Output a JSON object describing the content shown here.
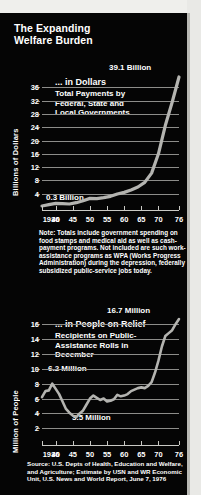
{
  "title": "The Expanding Welfare Burden",
  "title_line1": "The Expanding",
  "title_line2": "Welfare Burden",
  "note": "Note: Totals include government spending on food stamps and medical aid as well as cash-payment programs. Not included are such work-assistance programs as WPA (Works Progress Administration) during the depression, federally subsidized public-service jobs today.",
  "source": "Source: U.S. Depts of Health, Education and Welfare, and Agriculture; Estimate by USN and WR Economic Unit, U.S. News and World Report, June 7, 1976",
  "colors": {
    "background": "#050505",
    "paper": "#efefec",
    "text": "#ffffff",
    "series": "#b4b4b0",
    "grid": "#8d8d8a"
  },
  "chart_data": [
    {
      "type": "line",
      "id": "dollars",
      "title": "... in Dollars",
      "subtitle": "Total Payments by Federal, State and Local Governments",
      "subtitle_lines": [
        "Total Payments by",
        "Federal, State and",
        "Local Governments"
      ],
      "ylabel": "Billions of Dollars",
      "xlabel": "",
      "ylim": [
        0,
        39.1
      ],
      "yticks": [
        4,
        8,
        12,
        16,
        20,
        24,
        28,
        32,
        36
      ],
      "ytick_labels": [
        "4",
        "8",
        "12",
        "16",
        "20",
        "24",
        "28",
        "32",
        "36"
      ],
      "xlim": [
        1936,
        1976
      ],
      "xticks": [
        1936,
        1940,
        1945,
        1950,
        1955,
        1960,
        1965,
        1970,
        1976
      ],
      "xtick_labels": [
        "1936",
        "40",
        "45",
        "50",
        "55",
        "60",
        "65",
        "70",
        "76"
      ],
      "grid": true,
      "annotations": [
        {
          "text": "39.1 Billion",
          "x": 1976,
          "y": 39.1,
          "position": "top-right"
        },
        {
          "text": "0.3 Billion",
          "x": 1936,
          "y": 0.3,
          "position": "left"
        }
      ],
      "x": [
        1936,
        1938,
        1940,
        1942,
        1944,
        1946,
        1948,
        1950,
        1952,
        1954,
        1956,
        1958,
        1960,
        1962,
        1964,
        1966,
        1968,
        1970,
        1972,
        1974,
        1976
      ],
      "values": [
        0.3,
        0.7,
        1.1,
        1.0,
        0.9,
        1.3,
        1.9,
        2.6,
        2.5,
        2.8,
        3.2,
        3.9,
        4.4,
        5.1,
        6.0,
        7.4,
        10.2,
        16.0,
        24.5,
        31.5,
        39.1
      ]
    },
    {
      "type": "line",
      "id": "people",
      "title": "... in People on Relief",
      "subtitle": "Recipients on Public-Assistance Rolls in December",
      "subtitle_lines": [
        "Recipients on Public-",
        "Assistance Rolls in",
        "December"
      ],
      "ylabel": "Million of People",
      "xlabel": "",
      "ylim": [
        1.5,
        16.7
      ],
      "yticks": [
        2,
        4,
        6,
        8,
        10,
        12,
        14,
        16
      ],
      "ytick_labels": [
        "2",
        "4",
        "6",
        "8",
        "10",
        "12",
        "14",
        "16"
      ],
      "xlim": [
        1936,
        1976
      ],
      "xticks": [
        1936,
        1940,
        1945,
        1950,
        1955,
        1960,
        1965,
        1970,
        1976
      ],
      "xtick_labels": [
        "1936",
        "40",
        "45",
        "50",
        "55",
        "60",
        "65",
        "70",
        "76"
      ],
      "grid": true,
      "annotations": [
        {
          "text": "16.7 Million",
          "x": 1976,
          "y": 16.7,
          "position": "top-right"
        },
        {
          "text": "6.2 Million",
          "x": 1939,
          "y": 8.0,
          "position": "above"
        },
        {
          "text": "3.5 Million",
          "x": 1948,
          "y": 3.5,
          "position": "below"
        }
      ],
      "x": [
        1936,
        1937,
        1938,
        1939,
        1940,
        1941,
        1942,
        1943,
        1944,
        1945,
        1946,
        1947,
        1948,
        1949,
        1950,
        1951,
        1952,
        1953,
        1954,
        1955,
        1956,
        1957,
        1958,
        1959,
        1960,
        1961,
        1962,
        1963,
        1964,
        1965,
        1966,
        1967,
        1968,
        1969,
        1970,
        1971,
        1972,
        1973,
        1974,
        1975,
        1976
      ],
      "values": [
        6.2,
        7.0,
        7.1,
        8.0,
        7.3,
        6.6,
        5.6,
        4.6,
        4.1,
        3.7,
        3.5,
        4.0,
        4.4,
        5.2,
        6.0,
        6.4,
        6.1,
        5.8,
        6.0,
        5.6,
        5.7,
        5.9,
        6.5,
        6.3,
        6.4,
        6.6,
        7.0,
        7.2,
        7.4,
        7.5,
        7.4,
        7.7,
        8.2,
        9.5,
        11.1,
        13.0,
        14.4,
        14.8,
        15.2,
        16.0,
        16.7
      ]
    }
  ]
}
